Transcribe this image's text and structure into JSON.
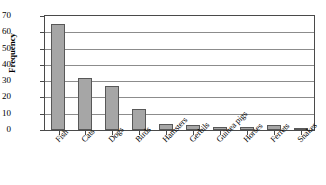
{
  "chart_data": {
    "type": "bar",
    "title": "",
    "xlabel": "",
    "ylabel": "Frequency",
    "categories": [
      "Fish",
      "Cats",
      "Dogs",
      "Birds",
      "Hamsters",
      "Gerbils",
      "Guinea pigs",
      "Horses",
      "Ferrets",
      "Snakes"
    ],
    "values": [
      65,
      32,
      27,
      13,
      4,
      3,
      2,
      2,
      3,
      1
    ],
    "ylim": [
      0,
      70
    ],
    "ytick_labels": [
      "70",
      "60",
      "50",
      "40",
      "30",
      "20",
      "10",
      "0"
    ],
    "ytick_values": [
      70,
      60,
      50,
      40,
      30,
      20,
      10,
      0
    ],
    "grid": true,
    "legend": false,
    "bar_color": "#a6a6a6",
    "bar_edge_color": "#585858",
    "grid_color": "#8c8c8c",
    "axis_color": "#4a4a4a",
    "background": "#ffffff"
  }
}
